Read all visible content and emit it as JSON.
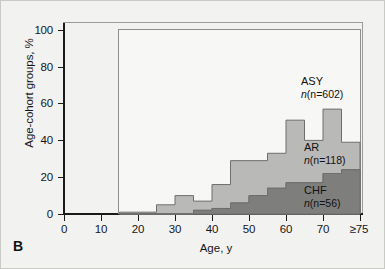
{
  "figure": {
    "panel_letter": "B",
    "background": "#f2f2f0"
  },
  "chart_data": {
    "type": "area",
    "subtype": "stacked-step-histogram",
    "title": "",
    "xlabel": "Age, y",
    "ylabel": "Age-cohort groups, %",
    "xlim": [
      0,
      80
    ],
    "ylim": [
      0,
      100
    ],
    "grid": false,
    "legend_position": "inline-annotations",
    "bin_width": 5,
    "bin_starts": [
      15,
      20,
      25,
      30,
      35,
      40,
      45,
      50,
      55,
      60,
      65,
      70,
      75
    ],
    "bin_labels": [
      "15-19",
      "20-24",
      "25-29",
      "30-34",
      "35-39",
      "40-44",
      "45-49",
      "50-54",
      "55-59",
      "60-64",
      "65-69",
      "70-74",
      "≥75"
    ],
    "series": [
      {
        "name": "ASY",
        "label": "ASY",
        "count_label": "(n=602)",
        "n": 602,
        "color": "#b9b9b7",
        "stacked_top_values": [
          1,
          1,
          5,
          10,
          7,
          16,
          29,
          29,
          33,
          51,
          40,
          57,
          39
        ]
      },
      {
        "name": "AR",
        "label": "AR",
        "count_label": "(n=118)",
        "n": 118,
        "color": "#9a9a98",
        "stacked_top_values": [
          0,
          0,
          0,
          0,
          2,
          3,
          6,
          10,
          14,
          17,
          17,
          22,
          24
        ]
      },
      {
        "name": "CHF",
        "label": "CHF",
        "count_label": "(n=56)",
        "n": 56,
        "color": "#7e7e7c",
        "stacked_top_values": [
          0,
          0,
          0,
          0,
          2,
          3,
          6,
          10,
          14,
          17,
          17,
          22,
          24
        ]
      }
    ],
    "yticks": [
      0,
      20,
      40,
      60,
      80,
      100
    ],
    "ytick_labels": [
      "0",
      "20",
      "40",
      "60",
      "80",
      "100"
    ],
    "xticks": [
      0,
      10,
      20,
      30,
      40,
      50,
      60,
      70,
      75
    ],
    "xtick_labels": [
      "0",
      "10",
      "20",
      "30",
      "40",
      "50",
      "60",
      "70",
      "≥75"
    ],
    "colors": {
      "asy": "#b9b9b7",
      "ar": "#9a9a98",
      "chf": "#7e7e7c",
      "axis": "#1a1a1a",
      "panel": "#f7f7f5",
      "outline": "#6e6e6c"
    }
  }
}
